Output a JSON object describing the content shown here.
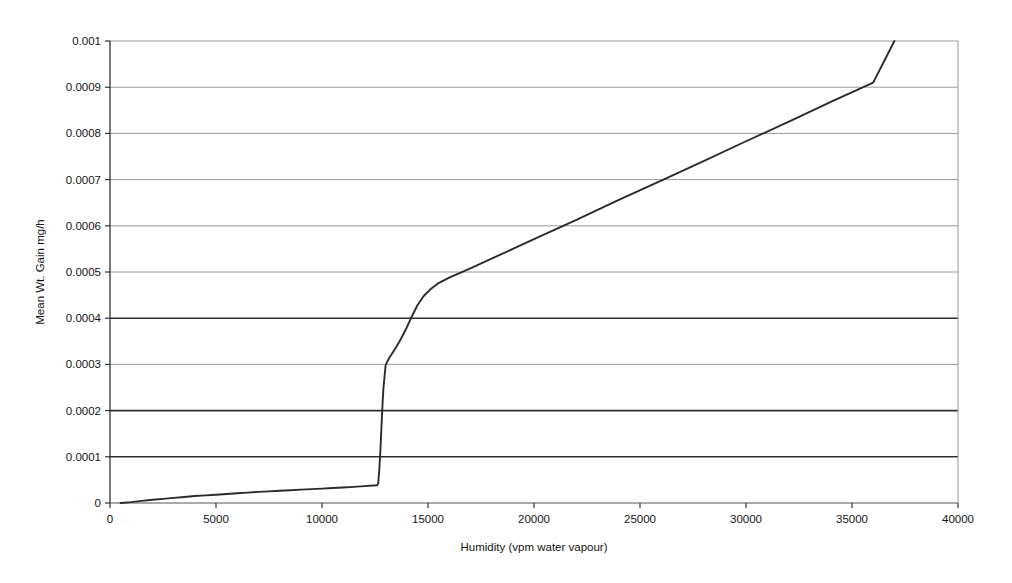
{
  "chart_data": {
    "type": "line",
    "title": "",
    "xlabel": "Humidity (vpm water vapour)",
    "ylabel": "Mean Wt. Gain mg/h",
    "xlim": [
      0,
      40000
    ],
    "ylim": [
      0,
      0.001
    ],
    "grid": true,
    "legend": "none",
    "xticks": [
      0,
      5000,
      10000,
      15000,
      20000,
      25000,
      30000,
      35000,
      40000
    ],
    "xtick_labels": [
      "0",
      "5000",
      "10000",
      "15000",
      "20000",
      "25000",
      "30000",
      "35000",
      "40000"
    ],
    "yticks": [
      0,
      0.0001,
      0.0002,
      0.0003,
      0.0004,
      0.0005,
      0.0006,
      0.0007,
      0.0008,
      0.0009,
      0.001
    ],
    "ytick_labels": [
      "0",
      "0.0001",
      "0.0002",
      "0.0003",
      "0.0004",
      "0.0005",
      "0.0006",
      "0.0007",
      "0.0008",
      "0.0009",
      "0.001"
    ],
    "emphasized_gridlines": [
      0.0001,
      0.0002,
      0.0004
    ],
    "series": [
      {
        "name": "Mean Wt. Gain",
        "color": "#2b2b2b",
        "x": [
          500,
          1000,
          1500,
          2000,
          2500,
          3000,
          3500,
          4000,
          4500,
          5000,
          5500,
          6000,
          6500,
          7000,
          7500,
          8000,
          8500,
          9000,
          9500,
          10000,
          10500,
          11000,
          11500,
          12000,
          12400,
          12600,
          12650,
          12700,
          12750,
          12800,
          12850,
          12900,
          13000,
          13100,
          13200,
          13400,
          13600,
          13800,
          14000,
          14200,
          14500,
          14800,
          15100,
          15500,
          16000,
          17000,
          18000,
          19000,
          20000,
          22000,
          24000,
          26000,
          28000,
          30000,
          32000,
          34000,
          36000,
          37000
        ],
        "y": [
          0.0,
          2e-06,
          4.5e-06,
          7e-06,
          9e-06,
          1.1e-05,
          1.3e-05,
          1.5e-05,
          1.65e-05,
          1.8e-05,
          1.95e-05,
          2.1e-05,
          2.25e-05,
          2.4e-05,
          2.52e-05,
          2.65e-05,
          2.77e-05,
          2.9e-05,
          3e-05,
          3.12e-05,
          3.25e-05,
          3.37e-05,
          3.5e-05,
          3.65e-05,
          3.78e-05,
          3.85e-05,
          4.2e-05,
          7e-05,
          0.00011,
          0.00016,
          0.00021,
          0.00025,
          0.000298,
          0.000308,
          0.000316,
          0.00033,
          0.000345,
          0.000362,
          0.00038,
          0.0004,
          0.000428,
          0.000448,
          0.000462,
          0.000476,
          0.000488,
          0.000508,
          0.000529,
          0.00055,
          0.000571,
          0.000613,
          0.000656,
          0.000698,
          0.00074,
          0.000783,
          0.000825,
          0.000868,
          0.00091,
          0.001
        ]
      }
    ]
  },
  "axis": {
    "y_title": "Mean Wt. Gain mg/h",
    "x_title": "Humidity (vpm water vapour)"
  }
}
